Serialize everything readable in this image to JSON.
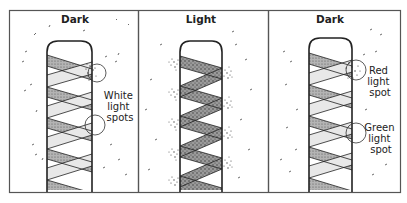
{
  "figure": {
    "panels": [
      {
        "id": "left",
        "title": "Dark",
        "annotation": [
          "White",
          "light",
          "spots"
        ],
        "spot_type": "white"
      },
      {
        "id": "middle",
        "title": "Light",
        "annotation": [],
        "spot_type": "none"
      },
      {
        "id": "right",
        "title": "Dark",
        "annotation_top": [
          "Red",
          "light",
          "spot"
        ],
        "annotation_bottom": [
          "Green",
          "light",
          "spot"
        ],
        "spot_type": "colored"
      }
    ],
    "colors": {
      "ink": "#2a2a2a",
      "border": "#555555",
      "band_dark": "#a8a8a8",
      "band_light": "#e6e6e6",
      "background": "#ffffff"
    }
  }
}
